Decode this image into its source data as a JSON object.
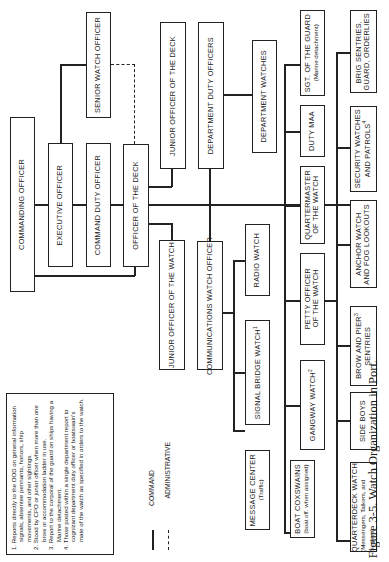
{
  "figure": {
    "caption": "Figure 3-5. Watch Organization in Port.",
    "orientation": "rotated 90° counter-clockwise"
  },
  "boxes": {
    "commanding_officer": "COMMANDING OFFICER",
    "executive_officer": "EXECUTIVE OFFICER",
    "senior_watch_officer": "SENIOR WATCH OFFICER",
    "command_duty_officer": "COMMAND DUTY OFFICER",
    "officer_of_the_deck": "OFFICER OF THE DECK",
    "junior_officer_of_the_deck": "JUNIOR OFFICER OF THE DECK",
    "department_duty_officers": "DEPARTMENT DUTY OFFICERS",
    "department_watches": "DEPARTMENT WATCHES",
    "junior_officer_of_the_watch": "JUNIOR OFFICER OF THE WATCH",
    "communications_watch_officer": "COMMUNICATIONS WATCH OFFICER",
    "radio_watch": "RADIO WATCH",
    "signal_bridge_watch": "SIGNAL BRIDGE WATCH",
    "signal_bridge_watch_note": "1",
    "message_center": "MESSAGE CENTER",
    "message_center_sub": "(Traffic)",
    "petty_officer_of_the_watch_1": "PETTY OFFICER",
    "petty_officer_of_the_watch_2": "OF THE WATCH",
    "gangway_watch": "GANGWAY WATCH",
    "gangway_watch_note": "2",
    "boat_coxswains": "BOAT COXSWAINS",
    "boat_coxswains_sub": "(boat off. when assigned)",
    "quartermaster_1": "QUARTERMASTER",
    "quartermaster_2": "OF THE WATCH",
    "duty_maa": "DUTY MAA",
    "sgt_of_the_guard": "SGT. OF THE GUARD",
    "sgt_of_the_guard_sub": "(Marine detachment)",
    "brig_sentries_1": "BRIG SENTRIES,",
    "brig_sentries_2": "GUARD, ORDERLIES",
    "security_watches_1": "SECURITY WATCHES",
    "security_watches_2": "AND PATROLS",
    "security_watches_note": "4",
    "anchor_watch_1": "ANCHOR WATCH",
    "anchor_watch_2": "AND FOG LOOKOUTS",
    "brow_and_pier_1": "BROW AND PIER",
    "brow_and_pier_note": "3",
    "brow_and_pier_2": "SENTRIES",
    "side_boys": "SIDE BOYS",
    "quarterdeck_watch": "QUARTERDECK WATCH",
    "quarterdeck_watch_sub1": "(Messengers, Talkers, and",
    "quarterdeck_watch_sub2": "Buglers)"
  },
  "legend": {
    "command": "COMMAND",
    "administrative": "ADMINISTRATIVE"
  },
  "notes": [
    "1. Reports directly to the OOD on general information signals, absentee pennants, honors, ship movements, and other sightings.",
    "2. Stood by CPO or junior officer when more than one brow or accommodation ladder in use.",
    "3. Report to the corporal of the guard on ships having a Marine detachment.",
    "4. Those posted within a single department report to cognizant department duty officer or boatswain's mate of the watch as specified in orders to the watch."
  ]
}
